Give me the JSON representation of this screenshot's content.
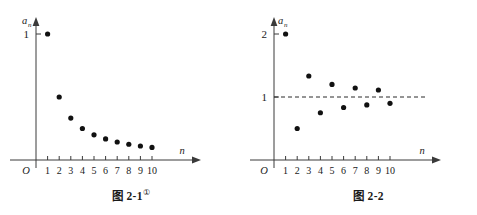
{
  "figures": [
    {
      "id": "fig-2-1",
      "caption_text": "图 2-1",
      "caption_mark": "①",
      "yaxis_label_base": "a",
      "yaxis_label_sub": "n",
      "xaxis_label": "n",
      "origin_label": "O",
      "ytick_labels": [
        "1"
      ],
      "xtick_labels": [
        "1",
        "2",
        "3",
        "4",
        "5",
        "6",
        "7",
        "8",
        "9",
        "10"
      ]
    },
    {
      "id": "fig-2-2",
      "caption_text": "图 2-2",
      "caption_mark": "",
      "yaxis_label_base": "a",
      "yaxis_label_sub": "n",
      "xaxis_label": "n",
      "origin_label": "O",
      "ytick_labels": [
        "2",
        "1"
      ],
      "xtick_labels": [
        "1",
        "2",
        "3",
        "4",
        "5",
        "6",
        "7",
        "8",
        "9",
        "10"
      ]
    }
  ],
  "colors": {
    "axis": "#3a3a3a",
    "point": "#111111",
    "asymptote": "#2a2a2a",
    "background": "#ffffff"
  },
  "chart_data": [
    {
      "type": "scatter",
      "title": "图 2-1",
      "xlabel": "n",
      "ylabel": "a_n",
      "x": [
        1,
        2,
        3,
        4,
        5,
        6,
        7,
        8,
        9,
        10
      ],
      "values": [
        1,
        0.5,
        0.333,
        0.25,
        0.2,
        0.167,
        0.143,
        0.125,
        0.111,
        0.1
      ],
      "series": [
        {
          "name": "a_n = 1/n",
          "values": [
            1,
            0.5,
            0.333,
            0.25,
            0.2,
            0.167,
            0.143,
            0.125,
            0.111,
            0.1
          ]
        }
      ],
      "xlim": [
        0,
        11
      ],
      "ylim": [
        0,
        1.18
      ],
      "xticks": [
        1,
        2,
        3,
        4,
        5,
        6,
        7,
        8,
        9,
        10
      ],
      "yticks": [
        1
      ],
      "grid": false,
      "legend": "none",
      "annotations": []
    },
    {
      "type": "scatter",
      "title": "图 2-2",
      "xlabel": "n",
      "ylabel": "a_n",
      "x": [
        1,
        2,
        3,
        4,
        5,
        6,
        7,
        8,
        9,
        10
      ],
      "values": [
        2,
        0.5,
        1.333,
        0.75,
        1.2,
        0.833,
        1.143,
        0.875,
        1.111,
        0.9
      ],
      "series": [
        {
          "name": "a_n = 1 + (-1)^n / n",
          "values": [
            2,
            0.5,
            1.333,
            0.75,
            1.2,
            0.833,
            1.143,
            0.875,
            1.111,
            0.9
          ]
        }
      ],
      "xlim": [
        0,
        11
      ],
      "ylim": [
        0,
        2.2
      ],
      "xticks": [
        1,
        2,
        3,
        4,
        5,
        6,
        7,
        8,
        9,
        10
      ],
      "yticks": [
        2,
        1
      ],
      "grid": false,
      "legend": "none",
      "annotations": [
        {
          "type": "hline",
          "y": 1,
          "style": "dashed",
          "label": ""
        }
      ]
    }
  ]
}
